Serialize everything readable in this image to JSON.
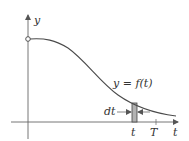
{
  "diagram": {
    "labels": {
      "y_axis": "y",
      "curve": "y = f(t)",
      "dt": "dt",
      "t_strip": "t",
      "T_mark": "T",
      "t_axis": "t"
    },
    "colors": {
      "line": "#4a4a4a",
      "axis": "#666666",
      "strip_fill": "#b3b3b3",
      "background": "#ffffff"
    },
    "elements": {
      "curve": "decreasing curve starting at open circle on y-axis, sigmoid-like decay toward t-axis",
      "strip": "thin shaded vertical rectangle of width dt at t under the curve",
      "open_circle": "open circle marking curve start at t = 0"
    }
  }
}
